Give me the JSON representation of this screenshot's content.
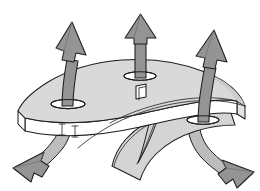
{
  "figure": {
    "title": "Draw-direction arrows through perforated curved panel",
    "type": "technical-line-illustration",
    "background_color": "#ffffff",
    "canvas": {
      "width": 260,
      "height": 191
    }
  },
  "palette": {
    "background": "#ffffff",
    "slab_top_face": "#d9d9d9",
    "slab_top_face_shaded": "#cfcfcf",
    "slab_edge_face": "#ffffff",
    "slab_side_face": "#e8e8e8",
    "skirt_face": "#d4d4d4",
    "skirt_face_dark": "#c6c6c6",
    "arrow_fill": "#949494",
    "arrow_fill_light": "#a8a8a8",
    "arrow_behind_fill": "#bdbdbd",
    "outline_stroke": "#1d1d1d",
    "hole_fill": "#ffffff"
  },
  "part": {
    "name": "curved-panel",
    "description": "Flat quadrilateral panel shown in isometric view with visible thickness, a curved swept flange hanging below the right half, and four openings in the top face.",
    "features": [
      {
        "id": "slot-left",
        "shape": "oval-slot",
        "label": "left oval slot"
      },
      {
        "id": "hole-center",
        "shape": "oval-hole",
        "label": "center oval hole"
      },
      {
        "id": "hole-square",
        "shape": "square-hole",
        "label": "small square hole"
      },
      {
        "id": "hole-right",
        "shape": "oval-hole",
        "label": "right oval hole"
      },
      {
        "id": "skirt",
        "shape": "swept-flange",
        "label": "curved lower flange"
      }
    ]
  },
  "arrows": [
    {
      "id": "arrow-up-left",
      "direction": "up-left",
      "label": "upper left draw arrow",
      "passes_through": "slot-left"
    },
    {
      "id": "arrow-up-center",
      "direction": "up",
      "label": "center draw arrow",
      "passes_through": "hole-center"
    },
    {
      "id": "arrow-up-right",
      "direction": "up-right",
      "label": "upper right draw arrow",
      "passes_through": "hole-right"
    },
    {
      "id": "arrow-down-left",
      "direction": "down-left",
      "label": "lower left draw arrow",
      "passes_through": "slot-left"
    },
    {
      "id": "arrow-down-right",
      "direction": "down-right",
      "label": "lower right draw arrow",
      "passes_through": "hole-right"
    }
  ],
  "labels": {
    "caption": "",
    "annotations": []
  }
}
